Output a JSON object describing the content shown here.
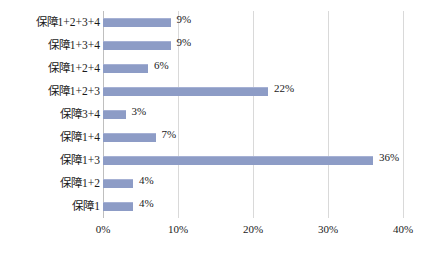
{
  "chart_data": {
    "type": "bar",
    "orientation": "horizontal",
    "title": "",
    "xlabel": "",
    "ylabel": "",
    "xlim": [
      0,
      40
    ],
    "xtick_labels": [
      "0%",
      "10%",
      "20%",
      "30%",
      "40%"
    ],
    "xtick_values": [
      0,
      10,
      20,
      30,
      40
    ],
    "grid": true,
    "legend": "none",
    "series_color": "#8d9cc6",
    "categories": [
      "保障1+2+3+4",
      "保障1+3+4",
      "保障1+2+4",
      "保障1+2+3",
      "保障3+4",
      "保障1+4",
      "保障1+3",
      "保障1+2",
      "保障1"
    ],
    "values": [
      9,
      9,
      6,
      22,
      3,
      7,
      36,
      4,
      4
    ],
    "data_labels": [
      "9%",
      "9%",
      "6%",
      "22%",
      "3%",
      "7%",
      "36%",
      "4%",
      "4%"
    ]
  }
}
